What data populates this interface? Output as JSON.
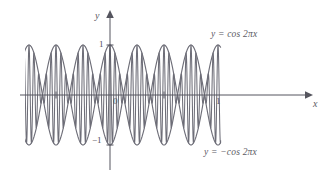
{
  "figure": {
    "background_color": "#ffffff",
    "curve_color": "#6e6e78",
    "axis_color": "#55555e",
    "labels": {
      "y_axis": "y",
      "x_axis": "x",
      "origin": "0",
      "y_tick_pos": "1",
      "y_tick_neg": "−1",
      "x_tick_one": "1",
      "upper_curve": "y = cos 2πx",
      "lower_curve": "y = −cos 2πx"
    }
  },
  "chart_data": {
    "type": "line",
    "title": "",
    "xlabel": "x",
    "ylabel": "y",
    "xlim": [
      -1.6,
      2.05
    ],
    "ylim": [
      -1.25,
      1.25
    ],
    "grid": false,
    "legend": "inline-annotations",
    "x_ticks": [
      -1,
      1
    ],
    "x_tick_labels": [
      "",
      "1"
    ],
    "y_ticks": [
      -1,
      1
    ],
    "y_tick_labels": [
      "−1",
      "1"
    ],
    "annotations": [
      {
        "text": "y = cos 2πx",
        "x": 1.35,
        "y": 1.12
      },
      {
        "text": "y = −cos 2πx",
        "x": 1.25,
        "y": -1.15
      },
      {
        "text": "0",
        "x": 0.06,
        "y": -0.12
      },
      {
        "text": "1",
        "x": -0.09,
        "y": 1.0
      },
      {
        "text": "−1",
        "x": -0.14,
        "y": -1.0
      }
    ],
    "series": [
      {
        "name": "y = cos 2πx",
        "formula": "cos(2*pi*x)",
        "amplitude": 1,
        "period": 1,
        "phase": 0,
        "color": "#6e6e78"
      },
      {
        "name": "y = -cos 2πx",
        "formula": "-cos(2*pi*x)",
        "amplitude": 1,
        "period": 1,
        "phase": 0,
        "color": "#6e6e78"
      },
      {
        "name": "oscillating function squeezed between envelopes",
        "formula": "cos(2*pi*x)*cos(22*pi*x)",
        "envelope_of": [
          "y = cos 2πx",
          "y = -cos 2πx"
        ],
        "color": "#6e6e78"
      }
    ]
  }
}
